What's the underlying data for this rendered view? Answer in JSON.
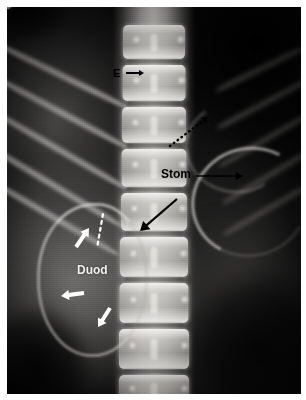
{
  "figure": {
    "kind": "radiograph",
    "modality": "plain abdominal X-ray",
    "projection": "anteroposterior",
    "border_color": "#ffffff",
    "film_color": "#000000",
    "width_px": 306,
    "height_px": 400
  },
  "annotations": {
    "labels": [
      {
        "id": "esophagus",
        "text": "E",
        "color": "#000000",
        "style": "dark",
        "x": 113,
        "y": 68,
        "font_size": 11
      },
      {
        "id": "stomach",
        "text": "Stom",
        "color": "#000000",
        "style": "dark",
        "x": 161,
        "y": 168,
        "font_size": 12
      },
      {
        "id": "duodenum",
        "text": "Duod",
        "color": "#f2f2f2",
        "style": "light",
        "x": 77,
        "y": 264,
        "font_size": 12
      }
    ],
    "arrows": [
      {
        "id": "esophagus-arrow",
        "kind": "solid",
        "color": "#000000",
        "points": "short horizontal arrow pointing right",
        "x1": 126,
        "y1": 73,
        "x2": 144,
        "y2": 73,
        "width": 2.0,
        "head": 5
      },
      {
        "id": "stomach-arrow",
        "kind": "solid",
        "color": "#000000",
        "points": "long horizontal arrow pointing right",
        "x1": 196,
        "y1": 176,
        "x2": 243,
        "y2": 176,
        "width": 1.6,
        "head": 7
      },
      {
        "id": "duodenojejunal-arrow",
        "kind": "solid",
        "color": "#000000",
        "points": "long arrow pointing down-left",
        "x1": 177,
        "y1": 199,
        "x2": 140,
        "y2": 231,
        "width": 2.2,
        "head": 9
      },
      {
        "id": "dotted-black-arrow",
        "kind": "dotted",
        "color": "#000000",
        "points": "dotted arrow pointing up-right",
        "x1": 170,
        "y1": 146,
        "x2": 208,
        "y2": 117,
        "width": 2.4,
        "head": 6
      },
      {
        "id": "duodenum-upper-arrow",
        "kind": "solid",
        "color": "#ffffff",
        "points": "white arrow pointing up-right",
        "x1": 76,
        "y1": 247,
        "x2": 89,
        "y2": 228,
        "width": 4.0,
        "head": 8
      },
      {
        "id": "duodenum-left-arrow",
        "kind": "solid",
        "color": "#ffffff",
        "points": "white arrow pointing left",
        "x1": 84,
        "y1": 293,
        "x2": 61,
        "y2": 296,
        "width": 4.2,
        "head": 8
      },
      {
        "id": "duodenum-lower-arrow",
        "kind": "solid",
        "color": "#ffffff",
        "points": "white arrow pointing down-left",
        "x1": 110,
        "y1": 308,
        "x2": 98,
        "y2": 327,
        "width": 4.0,
        "head": 8
      }
    ],
    "dotted_lines": [
      {
        "id": "white-dotted-marker",
        "color": "#ffffff",
        "x1": 103,
        "y1": 214,
        "x2": 97,
        "y2": 248,
        "width": 2.2,
        "dash": "3 4"
      }
    ]
  },
  "anatomy": {
    "structures": [
      {
        "id": "lumbar-spine",
        "label": "lumbar vertebral column",
        "visible": true
      },
      {
        "id": "ribs-left",
        "label": "lower rib shadows",
        "visible": true
      },
      {
        "id": "duodenal-loop",
        "label": "contrast-outlined duodenal loop",
        "visible": true
      },
      {
        "id": "stomach-wall",
        "label": "greater curvature of stomach",
        "visible": true
      },
      {
        "id": "gas-pocket",
        "label": "bowel gas lucency",
        "visible": true
      },
      {
        "id": "feeding-tube",
        "label": "radio-opaque enteric tube",
        "visible": true
      }
    ],
    "vertebrae": [
      {
        "id": "v1",
        "top": 18,
        "height": 34,
        "width": 62
      },
      {
        "id": "v2",
        "top": 58,
        "height": 36,
        "width": 63
      },
      {
        "id": "v3",
        "top": 100,
        "height": 36,
        "width": 64
      },
      {
        "id": "v4",
        "top": 142,
        "height": 38,
        "width": 65
      },
      {
        "id": "v5",
        "top": 186,
        "height": 38,
        "width": 66
      },
      {
        "id": "v6",
        "top": 230,
        "height": 40,
        "width": 68
      },
      {
        "id": "v7",
        "top": 276,
        "height": 40,
        "width": 69
      },
      {
        "id": "v8",
        "top": 322,
        "height": 40,
        "width": 70
      },
      {
        "id": "v9",
        "top": 368,
        "height": 30,
        "width": 70
      }
    ],
    "ribs": [
      {
        "id": "rib1",
        "left": -14,
        "top": 30,
        "width": 150,
        "rotate": 26
      },
      {
        "id": "rib2",
        "left": -18,
        "top": 62,
        "width": 158,
        "rotate": 28
      },
      {
        "id": "rib3",
        "left": -20,
        "top": 96,
        "width": 162,
        "rotate": 30
      },
      {
        "id": "rib4",
        "left": -22,
        "top": 132,
        "width": 160,
        "rotate": 31
      },
      {
        "id": "rib5",
        "left": -18,
        "top": 168,
        "width": 150,
        "rotate": 30
      }
    ]
  }
}
